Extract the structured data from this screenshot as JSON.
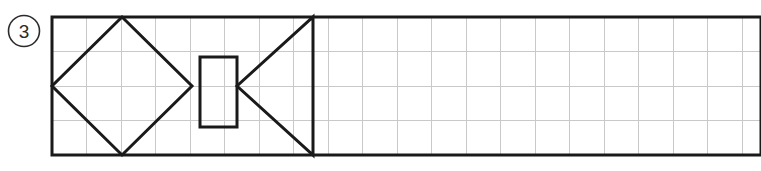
{
  "figure": {
    "question_number": "3",
    "background_color": "#ffffff",
    "stroke_color": "#1a1a1a",
    "grid_color": "#c9c9c9",
    "label_circle": {
      "name": "question-number-badge",
      "text": "3",
      "center_x": 24,
      "center_y": 31,
      "radius": 15.5,
      "stroke_width": 1.6
    },
    "outer_rectangle": {
      "name": "outer-grid-rectangle",
      "x": 52,
      "y": 17,
      "width": 709,
      "height": 138,
      "stroke_width": 3,
      "note": "extends past right edge of image"
    },
    "grid": {
      "cell_size": 34.5,
      "rows": 4,
      "columns": 20,
      "line_width": 1,
      "horizontal_lines_y": [
        51.5,
        86,
        120.5
      ],
      "vertical_lines_x": [
        86.5,
        121,
        155.5,
        190,
        224.5,
        259,
        293.5,
        328,
        362.5,
        397,
        431.5,
        466,
        500.5,
        535,
        569.5,
        604,
        638.5,
        673,
        707.5,
        742
      ]
    },
    "shapes": [
      {
        "name": "diamond-rotated-square",
        "type": "polygon",
        "points": "122,17 192,86 122,155 52,86",
        "stroke_width": 3,
        "fill": "none"
      },
      {
        "name": "inner-vertical-rectangle",
        "type": "rect",
        "x": 200,
        "y": 57,
        "width": 37,
        "height": 70,
        "stroke_width": 3,
        "fill": "none"
      },
      {
        "name": "left-pointing-triangle",
        "type": "polygon",
        "points": "313,17 313,155 237,86",
        "stroke_width": 3,
        "fill": "none"
      }
    ]
  }
}
